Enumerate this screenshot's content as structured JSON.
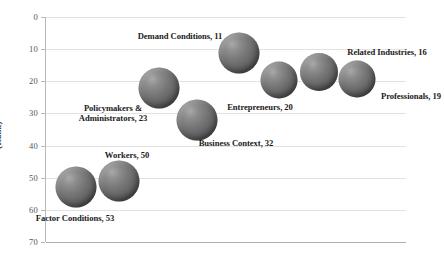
{
  "chart_data": {
    "type": "scatter",
    "title": "",
    "subtitle": "",
    "xlabel": "",
    "ylabel": "(Rank)",
    "grid": "horizontal",
    "legend": "none",
    "y_axis": {
      "ticks": [
        0,
        10,
        20,
        30,
        40,
        50,
        60,
        70
      ],
      "tick_labels": [
        "0",
        "10",
        "20",
        "30",
        "40",
        "50",
        "60",
        "70"
      ],
      "ylim": [
        0,
        70
      ],
      "inverted": true
    },
    "x_axis": {
      "ticks": [],
      "tick_labels": [],
      "xlim": [
        0,
        9
      ]
    },
    "categories": [
      "Factor Conditions",
      "Workers",
      "Policymakers & Administrators",
      "Business Context",
      "Demand Conditions",
      "Entrepreneurs",
      "Related Industries",
      "Professionals"
    ],
    "values": [
      53,
      50,
      23,
      32,
      11,
      20,
      16,
      19
    ],
    "points": [
      {
        "name": "factor-conditions",
        "label": "Factor Conditions, 53",
        "category": "Factor Conditions",
        "rank": 53,
        "x_index": 1,
        "cx_px": 75,
        "cy_px": 187,
        "d_px": 41,
        "label_x_px": 75,
        "label_y_px": 213,
        "label_align": "center"
      },
      {
        "name": "workers",
        "label": "Workers, 50",
        "category": "Workers",
        "rank": 50,
        "x_index": 2,
        "cx_px": 118,
        "cy_px": 181,
        "d_px": 41,
        "label_x_px": 127,
        "label_y_px": 150,
        "label_align": "center"
      },
      {
        "name": "policymakers-administrators",
        "label": "Policymakers &\nAdministrators, 23",
        "label_line1": "Policymakers &",
        "label_line2": "Administrators, 23",
        "category": "Policymakers & Administrators",
        "rank": 23,
        "x_index": 3,
        "cx_px": 158,
        "cy_px": 88,
        "d_px": 41,
        "label_x_px": 113,
        "label_y_px": 103,
        "label_align": "center"
      },
      {
        "name": "business-context",
        "label": "Business Context, 32",
        "category": "Business Context",
        "rank": 32,
        "x_index": 4,
        "cx_px": 196,
        "cy_px": 120,
        "d_px": 41,
        "label_x_px": 236,
        "label_y_px": 138,
        "label_align": "center"
      },
      {
        "name": "demand-conditions",
        "label": "Demand Conditions, 11",
        "category": "Demand Conditions",
        "rank": 11,
        "x_index": 5,
        "cx_px": 238,
        "cy_px": 53,
        "d_px": 41,
        "label_x_px": 180,
        "label_y_px": 31,
        "label_align": "center"
      },
      {
        "name": "entrepreneurs",
        "label": "Entrepreneurs, 20",
        "category": "Entrepreneurs",
        "rank": 20,
        "x_index": 6,
        "cx_px": 278,
        "cy_px": 80,
        "d_px": 37,
        "label_x_px": 260,
        "label_y_px": 102,
        "label_align": "center"
      },
      {
        "name": "related-industries",
        "label": "Related Industries, 16",
        "category": "Related Industries",
        "rank": 16,
        "x_index": 7,
        "cx_px": 318,
        "cy_px": 72,
        "d_px": 38,
        "label_x_px": 387,
        "label_y_px": 47,
        "label_align": "center"
      },
      {
        "name": "professionals",
        "label": "Professionals, 19",
        "category": "Professionals",
        "rank": 19,
        "x_index": 8,
        "cx_px": 356,
        "cy_px": 79,
        "d_px": 37,
        "label_x_px": 411,
        "label_y_px": 91,
        "label_align": "center"
      }
    ],
    "colors": {
      "bubble_fill": "#6b6b6b",
      "bubble_highlight": "#a9a9a9",
      "bubble_shadow": "#3e3e3e",
      "gridline": "#e2e2e2",
      "axis": "#b9b9b9",
      "tick_label": "#555555",
      "data_label": "#1a1a1a",
      "background": "#ffffff"
    }
  }
}
